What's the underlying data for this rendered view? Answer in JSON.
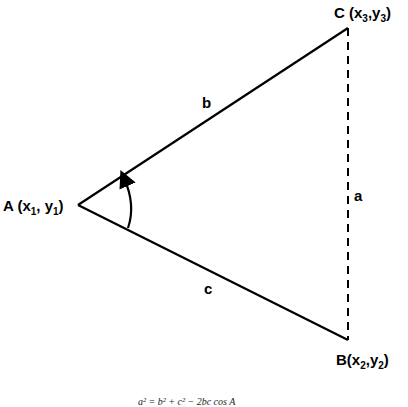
{
  "diagram": {
    "type": "triangle-law-of-cosines",
    "vertices": {
      "A": {
        "label": "A",
        "coords_label": [
          "x",
          "1",
          "y",
          "1"
        ],
        "x": 78,
        "y": 205
      },
      "B": {
        "label": "B",
        "coords_label": [
          "x",
          "2",
          "y",
          "2"
        ],
        "x": 348,
        "y": 340
      },
      "C": {
        "label": "C",
        "coords_label": [
          "x",
          "3",
          "y",
          "3"
        ],
        "x": 348,
        "y": 28
      }
    },
    "sides": {
      "a": {
        "label": "a",
        "from": "B",
        "to": "C",
        "style": "dashed"
      },
      "b": {
        "label": "b",
        "from": "A",
        "to": "C",
        "style": "solid"
      },
      "c": {
        "label": "c",
        "from": "A",
        "to": "B",
        "style": "solid"
      }
    },
    "angle_marker": {
      "vertex": "A",
      "style": "arc-with-arrow"
    },
    "formula": "a² = b² + c² − 2bc cos A",
    "colors": {
      "line": "#000000",
      "background": "#ffffff"
    }
  }
}
